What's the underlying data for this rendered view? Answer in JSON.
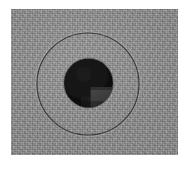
{
  "figure": {
    "title": "Grayscale micrograph of circular specimen",
    "canvas": {
      "width_px": 191,
      "height_px": 169,
      "background_color": "#ffffff"
    },
    "plate": {
      "label": "photographic plate",
      "x_px": 11,
      "y_px": 9,
      "width_px": 167,
      "height_px": 146,
      "base_color": "#8b8b8b",
      "texture": "film-grain-noise"
    }
  },
  "features": {
    "outer_ring": {
      "label": "outer circular boundary",
      "center_x_px": 77,
      "center_y_px": 75,
      "radius_px": 51,
      "stroke_color": "#3a3a3a",
      "stroke_width_px": 1.2,
      "fill": "none"
    },
    "inner_disc": {
      "label": "dark central disc",
      "center_x_px": 77.5,
      "center_y_px": 74,
      "radius_px": 24.5,
      "fill_color": "#141414"
    },
    "bright_quadrant": {
      "label": "lighter lower-right quadrant wedge",
      "fill_color": "#3c3c3c",
      "quadrant": "lower-right",
      "boundary_horizontal_y_px": 78,
      "boundary_vertical_x_px": 79
    },
    "quadrant_shading": {
      "label": "faint internal shading band",
      "fill_color": "#232323"
    }
  },
  "chart_data": {
    "type": "heatmap",
    "title": "Grayscale micrograph of circular specimen",
    "xlabel": "",
    "ylabel": "",
    "grid": false,
    "legend": "none",
    "annotations": [
      "outer ring radius 51 px",
      "inner disc radius 24.5 px",
      "lighter wedge occupies lower-right quadrant of inner disc"
    ],
    "regions": [
      {
        "name": "background plate",
        "gray_level": 139,
        "hex": "#8b8b8b"
      },
      {
        "name": "outer ring stroke",
        "gray_level": 58,
        "hex": "#3a3a3a"
      },
      {
        "name": "inner disc",
        "gray_level": 20,
        "hex": "#141414"
      },
      {
        "name": "lower-right quadrant wedge",
        "gray_level": 60,
        "hex": "#3c3c3c"
      },
      {
        "name": "page margin",
        "gray_level": 255,
        "hex": "#ffffff"
      }
    ]
  }
}
